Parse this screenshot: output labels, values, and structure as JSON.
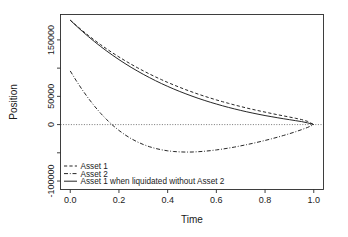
{
  "chart_data": {
    "type": "line",
    "title": "",
    "xlabel": "Time",
    "ylabel": "Position",
    "xlim": [
      -0.04,
      1.04
    ],
    "ylim": [
      -115000,
      195000
    ],
    "xticks": [
      0.0,
      0.2,
      0.4,
      0.6,
      0.8,
      1.0
    ],
    "xtick_labels": [
      "0.0",
      "0.2",
      "0.4",
      "0.6",
      "0.8",
      "1.0"
    ],
    "yticks": [
      -100000,
      -50000,
      0,
      50000,
      100000,
      150000
    ],
    "ytick_labels": [
      "-100000",
      "",
      "0",
      "50000",
      "",
      "150000"
    ],
    "grid": false,
    "legend_position": "bottom-left",
    "reference_lines": [
      {
        "name": "zero-line",
        "orientation": "horizontal",
        "value": 0,
        "style": "dotted"
      }
    ],
    "x": [
      0.0,
      0.025,
      0.05,
      0.075,
      0.1,
      0.125,
      0.15,
      0.175,
      0.2,
      0.225,
      0.25,
      0.275,
      0.3,
      0.325,
      0.35,
      0.375,
      0.4,
      0.425,
      0.45,
      0.475,
      0.5,
      0.525,
      0.55,
      0.575,
      0.6,
      0.625,
      0.65,
      0.675,
      0.7,
      0.725,
      0.75,
      0.775,
      0.8,
      0.825,
      0.85,
      0.875,
      0.9,
      0.925,
      0.95,
      0.975,
      1.0
    ],
    "series": [
      {
        "name": "Asset 1",
        "style": "dashed",
        "values": [
          185000,
          175500,
          166400,
          157700,
          149400,
          141500,
          133900,
          126700,
          119800,
          113200,
          106900,
          100900,
          95200,
          89700,
          84500,
          79500,
          74700,
          70200,
          65900,
          61700,
          57800,
          54000,
          50400,
          47000,
          43700,
          40600,
          37600,
          34700,
          32000,
          29300,
          26800,
          24400,
          22100,
          19800,
          17600,
          15500,
          13400,
          11200,
          8900,
          5600,
          0
        ]
      },
      {
        "name": "Asset 2",
        "style": "dashdot",
        "values": [
          95000,
          77500,
          61200,
          46200,
          32400,
          19900,
          8600,
          -1500,
          -10400,
          -18200,
          -24900,
          -30600,
          -35300,
          -39200,
          -42300,
          -44700,
          -46500,
          -47700,
          -48400,
          -48700,
          -48600,
          -48100,
          -47300,
          -46200,
          -44900,
          -43400,
          -41700,
          -39800,
          -37700,
          -35500,
          -33200,
          -30700,
          -28100,
          -25400,
          -22500,
          -19400,
          -16200,
          -12700,
          -9000,
          -5000,
          0
        ]
      },
      {
        "name": "Asset 1 when liquidated without Asset 2",
        "style": "solid",
        "values": [
          185000,
          174800,
          165000,
          155700,
          146800,
          138300,
          130200,
          122500,
          115100,
          108100,
          101400,
          95100,
          89000,
          83300,
          77800,
          72600,
          67700,
          63000,
          58600,
          54400,
          50400,
          46600,
          43000,
          39600,
          36400,
          33300,
          30400,
          27700,
          25100,
          22600,
          20300,
          18100,
          16000,
          14100,
          12200,
          10400,
          8700,
          7000,
          5300,
          3000,
          0
        ]
      }
    ]
  },
  "axes": {
    "y_title": "Position",
    "x_title": "Time"
  },
  "legend": {
    "entries": [
      {
        "label": "Asset 1",
        "style": "dashed"
      },
      {
        "label": "Asset 2",
        "style": "dashdot"
      },
      {
        "label": "Asset 1 when liquidated without Asset 2",
        "style": "solid"
      }
    ]
  },
  "colors": {
    "background": "#ffffff",
    "foreground": "#1a1a1a",
    "frame": "#2b2b2b",
    "zero_line": "#555555"
  }
}
